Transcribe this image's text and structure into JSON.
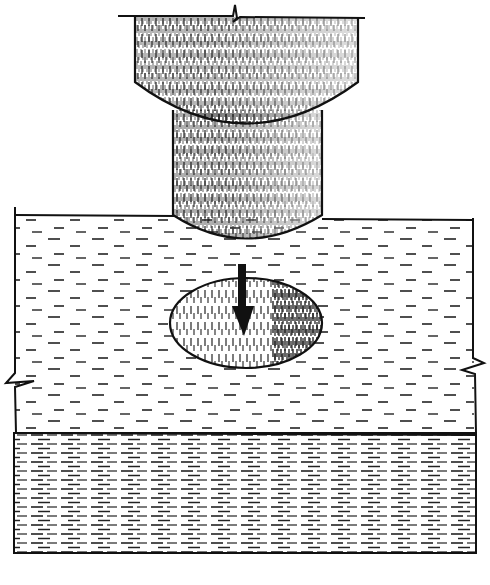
{
  "figure": {
    "type": "line-drawing illustration",
    "elements": [
      {
        "name": "plug-cap",
        "description": "wide upper cylindrical cap with break mark at top edge"
      },
      {
        "name": "plug-shank",
        "description": "narrower cylindrical shank beneath cap"
      },
      {
        "name": "upper-layer",
        "description": "light-hatched block with break marks on left and right edges"
      },
      {
        "name": "hole",
        "description": "elliptical hole in upper layer"
      },
      {
        "name": "down-arrow",
        "description": "bold arrow pointing downward into hole"
      },
      {
        "name": "lower-layer",
        "description": "densely hatched base layer"
      }
    ],
    "colors": {
      "ink": "#111111",
      "paper": "#ffffff"
    }
  }
}
